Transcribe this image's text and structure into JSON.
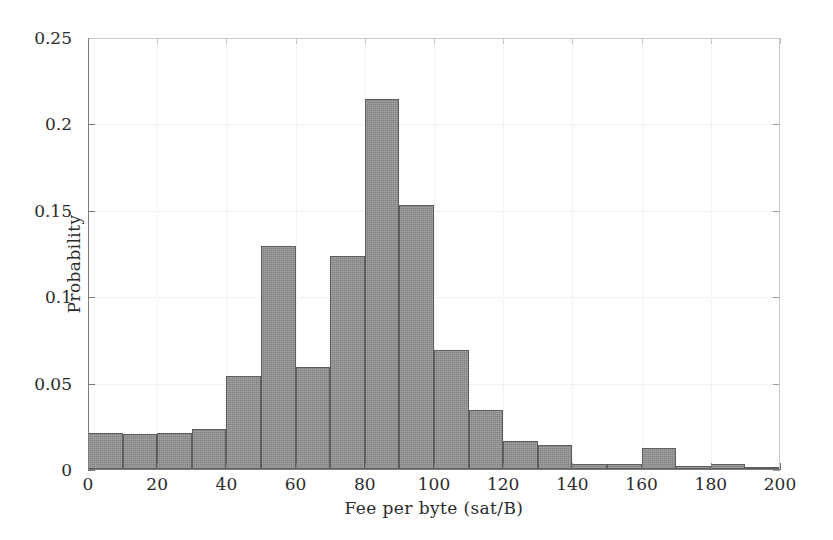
{
  "chart_data": {
    "type": "bar",
    "title": "",
    "xlabel": "Fee per byte (sat/B)",
    "ylabel": "Probability",
    "xlim": [
      0,
      200
    ],
    "ylim": [
      0,
      0.25
    ],
    "grid": true,
    "legend": null,
    "bin_width": 10,
    "xticks": [
      0,
      20,
      40,
      60,
      80,
      100,
      120,
      140,
      160,
      180,
      200
    ],
    "xtick_labels": [
      "0",
      "20",
      "40",
      "60",
      "80",
      "100",
      "120",
      "140",
      "160",
      "180",
      "200"
    ],
    "yticks": [
      0,
      0.05,
      0.1,
      0.15,
      0.2,
      0.25
    ],
    "ytick_labels": [
      "0",
      "0.05",
      "0.1",
      "0.15",
      "0.2",
      "0.25"
    ],
    "bin_edges": [
      0,
      10,
      20,
      30,
      40,
      50,
      60,
      70,
      80,
      90,
      100,
      110,
      120,
      130,
      140,
      150,
      160,
      170,
      180,
      190,
      200
    ],
    "categories": [
      "0-10",
      "10-20",
      "20-30",
      "30-40",
      "40-50",
      "50-60",
      "60-70",
      "70-80",
      "80-90",
      "90-100",
      "100-110",
      "110-120",
      "120-130",
      "130-140",
      "140-150",
      "150-160",
      "160-170",
      "170-180",
      "180-190",
      "190-200"
    ],
    "values": [
      0.021,
      0.02,
      0.021,
      0.023,
      0.054,
      0.129,
      0.059,
      0.123,
      0.214,
      0.153,
      0.069,
      0.034,
      0.016,
      0.014,
      0.003,
      0.003,
      0.012,
      0.002,
      0.003,
      0.001
    ],
    "bar_color": "#8f8f8f",
    "bar_edge_color": "#5d5d5d"
  },
  "figure": {
    "background": "#ffffff",
    "axis_color": "#7c7c7c",
    "text_color": "#2b2b2b"
  }
}
